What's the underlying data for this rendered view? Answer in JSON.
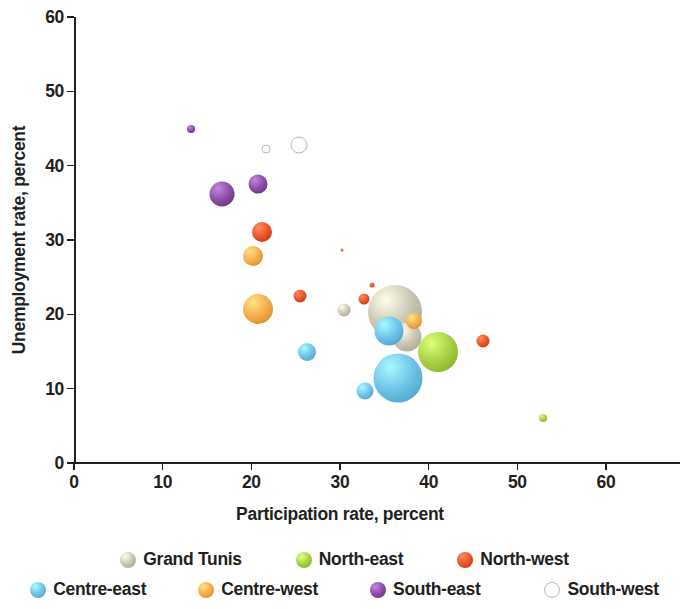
{
  "chart_data": {
    "type": "scatter",
    "title": "",
    "xlabel": "Participation rate, percent",
    "ylabel": "Unemployment rate, percent",
    "xlim": [
      0,
      60
    ],
    "ylim": [
      0,
      60
    ],
    "xticks": [
      0,
      10,
      20,
      30,
      40,
      50,
      60
    ],
    "yticks": [
      0,
      10,
      20,
      30,
      40,
      50,
      60
    ],
    "grid": false,
    "legend_position": "bottom",
    "bubble_size_encodes": "population",
    "series": [
      {
        "name": "Grand Tunis",
        "color": "#c9c7b4",
        "points": [
          {
            "x": 30.4,
            "y": 20.6,
            "size": 13
          },
          {
            "x": 36.2,
            "y": 20.3,
            "size": 54
          },
          {
            "x": 37.6,
            "y": 17.0,
            "size": 29
          }
        ]
      },
      {
        "name": "North-east",
        "color": "#a8d146",
        "points": [
          {
            "x": 35.4,
            "y": 17.9,
            "size": 26
          },
          {
            "x": 41.0,
            "y": 15.0,
            "size": 40
          },
          {
            "x": 52.9,
            "y": 6.1,
            "size": 8
          }
        ]
      },
      {
        "name": "North-west",
        "color": "#e8562a",
        "points": [
          {
            "x": 21.2,
            "y": 31.1,
            "size": 20
          },
          {
            "x": 25.5,
            "y": 22.5,
            "size": 13
          },
          {
            "x": 32.7,
            "y": 22.0,
            "size": 11
          },
          {
            "x": 33.6,
            "y": 24.0,
            "size": 5
          },
          {
            "x": 46.1,
            "y": 16.4,
            "size": 13
          },
          {
            "x": 30.2,
            "y": 28.6,
            "size": 3
          }
        ]
      },
      {
        "name": "Centre-east",
        "color": "#70c3e8",
        "points": [
          {
            "x": 26.3,
            "y": 14.9,
            "size": 18
          },
          {
            "x": 32.8,
            "y": 9.7,
            "size": 17
          },
          {
            "x": 35.5,
            "y": 17.8,
            "size": 29
          },
          {
            "x": 36.5,
            "y": 11.4,
            "size": 49
          }
        ]
      },
      {
        "name": "Centre-west",
        "color": "#f5ad4e",
        "points": [
          {
            "x": 20.2,
            "y": 27.8,
            "size": 20
          },
          {
            "x": 20.8,
            "y": 20.7,
            "size": 30
          },
          {
            "x": 38.4,
            "y": 19.1,
            "size": 16
          }
        ]
      },
      {
        "name": "South-east",
        "color": "#8b4fa8",
        "points": [
          {
            "x": 13.2,
            "y": 44.9,
            "size": 8
          },
          {
            "x": 16.7,
            "y": 36.2,
            "size": 25
          },
          {
            "x": 20.8,
            "y": 37.6,
            "size": 19
          }
        ]
      },
      {
        "name": "South-west",
        "color": "#ffffff",
        "outline": "#b9b9b9",
        "hollow": true,
        "points": [
          {
            "x": 21.6,
            "y": 42.2,
            "size": 9
          },
          {
            "x": 25.4,
            "y": 42.8,
            "size": 17
          }
        ]
      }
    ]
  },
  "axes": {
    "y_title": "Unemployment rate, percent",
    "x_title": "Participation rate, percent",
    "y_tick_labels": [
      "60",
      "50",
      "40",
      "30",
      "20",
      "10",
      "0"
    ],
    "x_tick_labels": [
      "0",
      "10",
      "20",
      "30",
      "40",
      "50",
      "60"
    ]
  },
  "legend": {
    "rows": [
      [
        {
          "label": "Grand Tunis",
          "color": "#c9c7b4",
          "outline": "#b0ae9c",
          "hollow": false
        },
        {
          "label": "North-east",
          "color": "#a8d146",
          "outline": "#8fb737",
          "hollow": false
        },
        {
          "label": "North-west",
          "color": "#e8562a",
          "outline": "#c94319",
          "hollow": false
        }
      ],
      [
        {
          "label": "Centre-east",
          "color": "#70c3e8",
          "outline": "#4aa9d4",
          "hollow": false
        },
        {
          "label": "Centre-west",
          "color": "#f5ad4e",
          "outline": "#dd9333",
          "hollow": false
        },
        {
          "label": "South-east",
          "color": "#8b4fa8",
          "outline": "#6f3a88",
          "hollow": false
        },
        {
          "label": "South-west",
          "color": "#ffffff",
          "outline": "#b9b9b9",
          "hollow": true
        }
      ]
    ]
  }
}
